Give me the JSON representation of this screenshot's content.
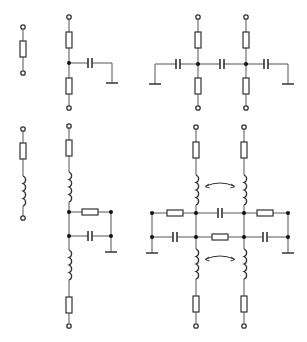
{
  "figure": {
    "caption": "",
    "colors": {
      "line": "#555555",
      "component": "#333333",
      "background": "#ffffff"
    },
    "circuits": [
      {
        "id": "a",
        "label": "Single resistor (two-terminal)",
        "components": [
          "terminal",
          "resistor",
          "terminal"
        ]
      },
      {
        "id": "b",
        "label": "Resistor T-network with shunt capacitor to ground",
        "components": [
          "terminal",
          "resistor",
          "junction",
          "capacitor",
          "ground",
          "resistor",
          "terminal"
        ]
      },
      {
        "id": "c",
        "label": "Two coupled resistor T-networks with series capacitors to ground",
        "components": [
          "terminal",
          "resistor",
          "capacitor",
          "ground",
          "capacitor",
          "capacitor",
          "ground"
        ]
      },
      {
        "id": "d",
        "label": "Resistor in series with inductor",
        "components": [
          "terminal",
          "resistor",
          "inductor",
          "terminal"
        ]
      },
      {
        "id": "e",
        "label": "Series R-L-L-R line with parallel R and C branch to ground",
        "components": [
          "terminal",
          "resistor",
          "inductor",
          "resistor",
          "capacitor",
          "ground",
          "inductor",
          "resistor",
          "terminal"
        ]
      },
      {
        "id": "f",
        "label": "Coupled dual R-L lines with R/C cross network (mutual coupling arrows)",
        "components": [
          "terminal",
          "resistor",
          "inductor",
          "coupling-arrow",
          "resistor",
          "capacitor",
          "ground",
          "inductor",
          "resistor",
          "terminal"
        ]
      }
    ]
  }
}
